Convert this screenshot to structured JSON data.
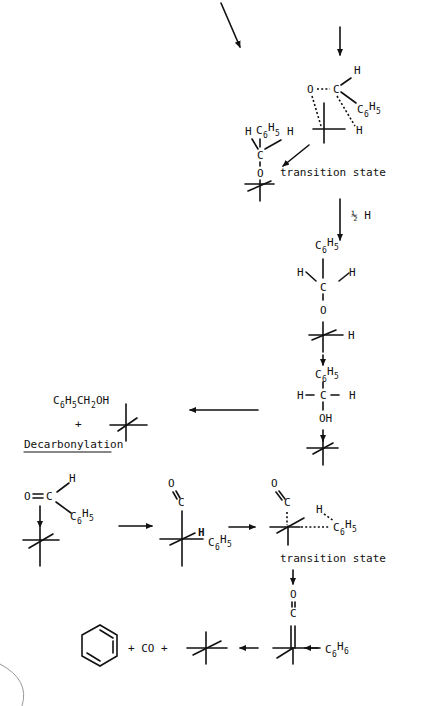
{
  "labels": {
    "transition_state_1": "transition state",
    "half_h": "½ H",
    "product_alcohol": "C6H5CH2OH",
    "plus": "+",
    "decarbonylation": "Decarbonylation",
    "transition_state_2": "transition state",
    "plus_co": "+ CO +",
    "c6h6": "C6H6"
  },
  "atoms": {
    "O": "O",
    "C": "C",
    "H": "H",
    "OH": "OH",
    "C6": "C",
    "sub6": "6",
    "H5": "H",
    "sub5": "5"
  }
}
